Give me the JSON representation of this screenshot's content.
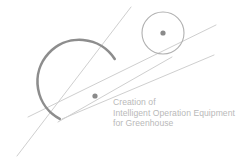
{
  "image": {
    "kind": "logo-graphic",
    "width": 246,
    "height": 162,
    "background_color": "#ffffff"
  },
  "tagline": {
    "line1": "Creation of",
    "line2": "Intelligent Operation Equipment",
    "line3": "for Greenhouse",
    "color": "#b9b9b9"
  },
  "graphic": {
    "colors": {
      "arc": "#8d8d8d",
      "small_circle": "#b0b0b0",
      "line": "#cfcfcf",
      "dot": "#8a8a8a"
    },
    "large_arc": {
      "center_x": 95,
      "center_y": 96,
      "radius": 42,
      "stroke_width": 2.6,
      "gap_description": "open on the right side"
    },
    "large_arc_dot": {
      "cx": 95,
      "cy": 96,
      "r": 2.6
    },
    "small_circle": {
      "cx": 163,
      "cy": 33,
      "r": 21,
      "stroke_width": 1.1
    },
    "small_circle_dot": {
      "cx": 163,
      "cy": 33,
      "r": 2.6
    },
    "lines": [
      {
        "name": "upper-tangent-line",
        "x1": 28,
        "y1": 117,
        "x2": 216,
        "y2": 25
      },
      {
        "name": "lower-tangent-line",
        "x1": 62,
        "y1": 119,
        "x2": 214,
        "y2": 55
      },
      {
        "name": "steep-crossing-line",
        "x1": 131,
        "y1": 7,
        "x2": 17,
        "y2": 156
      },
      {
        "name": "rising-crossing-line",
        "x1": 58,
        "y1": 122,
        "x2": 172,
        "y2": 57
      }
    ]
  }
}
